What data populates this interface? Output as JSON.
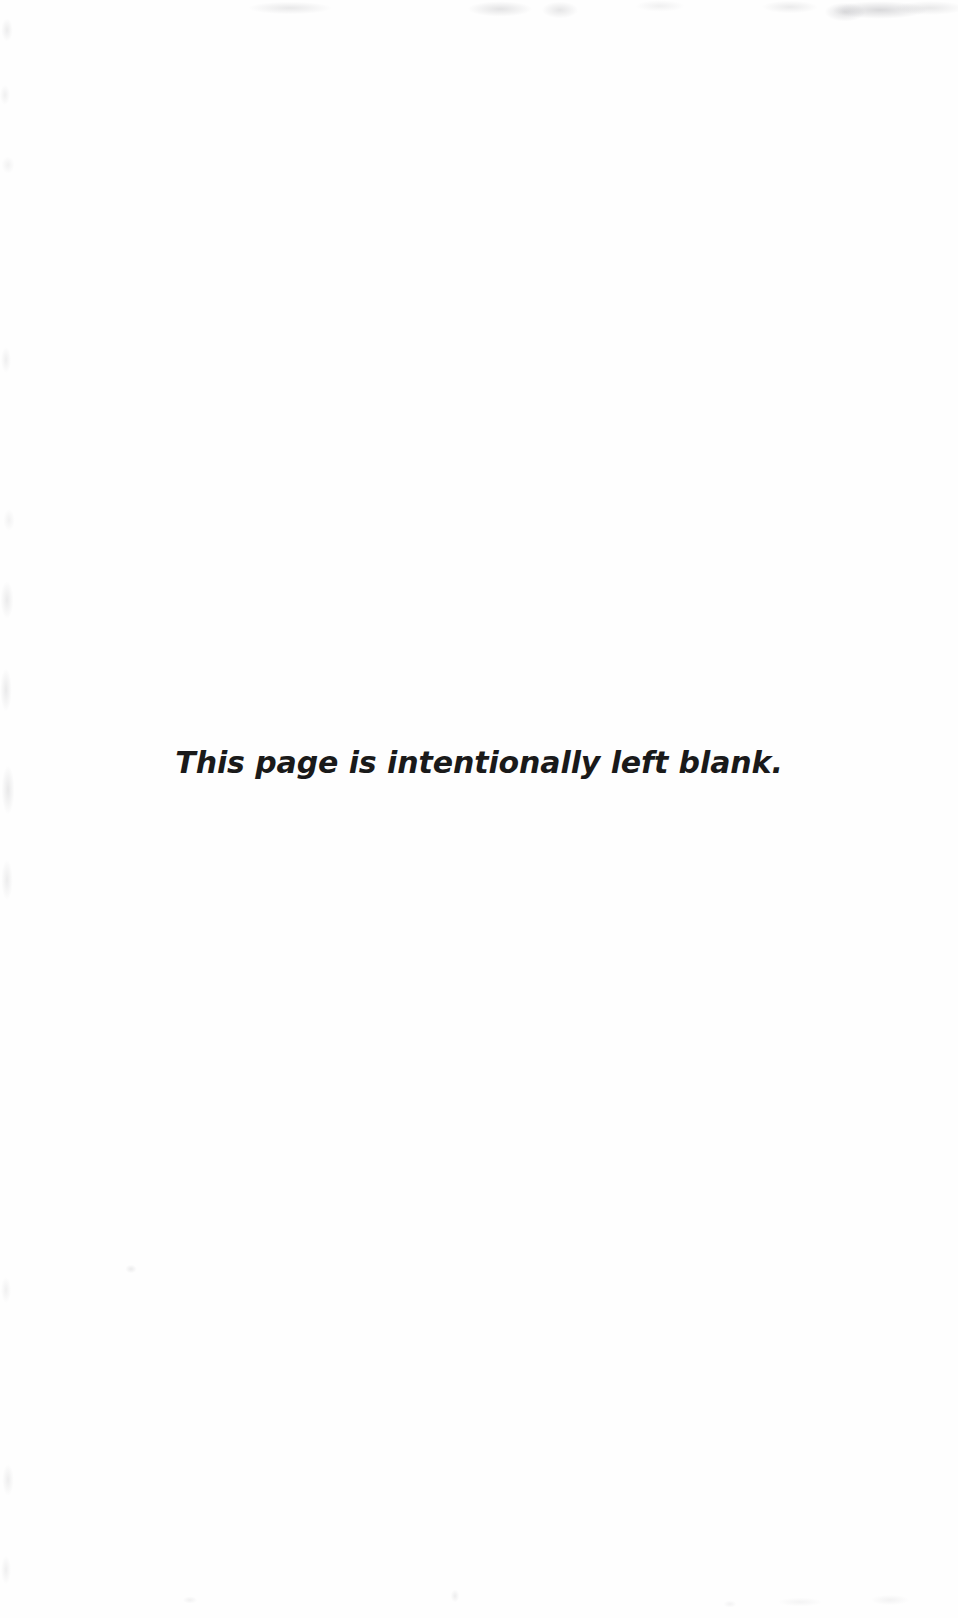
{
  "page": {
    "width": 958,
    "height": 1618,
    "background_color": "#fefefe",
    "document_type": "scanned-page"
  },
  "content": {
    "blank_notice": "This page is intentionally left blank.",
    "text_color": "#1a1a1a",
    "alignment": "center"
  },
  "artifacts": {
    "description": "faint grayscale scanner smudges along page edges",
    "color": "#f4f4f6",
    "regions": [
      "top-edge",
      "top-right-corner",
      "left-edge",
      "bottom-edge",
      "lower-left-speck"
    ]
  }
}
